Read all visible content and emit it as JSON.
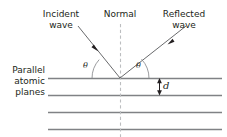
{
  "figure": {
    "type": "physics-diagram",
    "width": 227,
    "height": 137,
    "background_color": "#ffffff",
    "ink_color": "#231f20",
    "plane_line_color": "#808285",
    "normal_line_color": "#bcbec0"
  },
  "labels": {
    "incident_wave": {
      "line1": "Incident",
      "line2": "wave"
    },
    "normal": {
      "line1": "Normal"
    },
    "reflected_wave": {
      "line1": "Reflected",
      "line2": "wave"
    },
    "parallel_atomic_planes": {
      "line1": "Parallel",
      "line2": "atomic",
      "line3": "planes"
    },
    "theta_incidence": "θ",
    "theta_reflection": "θ",
    "spacing_d": "d"
  },
  "geometry": {
    "vertex": {
      "x": 120,
      "y": 78
    },
    "atomic_planes_y": [
      78,
      95,
      112,
      129
    ],
    "atomic_planes_x_start": 48,
    "atomic_planes_x_end": 222,
    "normal_line": {
      "x": 120,
      "y_top": 24,
      "y_bottom": 137,
      "style": "dashed"
    },
    "incident_ray": {
      "x1": 78,
      "y1": 26,
      "x2": 120,
      "y2": 78
    },
    "reflected_ray": {
      "x1": 120,
      "y1": 78,
      "x2": 186,
      "y2": 26
    },
    "incident_arrowhead": {
      "x": 96,
      "y": 48
    },
    "reflected_arrowhead": {
      "x": 169,
      "y": 43
    },
    "theta_arc_radius": 30,
    "d_measure": {
      "x": 160,
      "y_top": 78,
      "y_bottom": 95
    }
  }
}
